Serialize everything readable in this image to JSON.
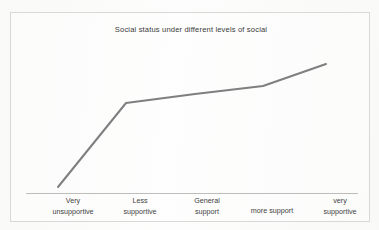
{
  "chart_data": {
    "type": "line",
    "title": "Social status under different levels of social",
    "xlabel": "",
    "ylabel": "",
    "categories": [
      "Very unsupportive",
      "Less supportive",
      "General support",
      "more support",
      "very supportive"
    ],
    "category_lines": [
      [
        "Very",
        "unsupportive"
      ],
      [
        "Less",
        "supportive"
      ],
      [
        "General",
        "support"
      ],
      [
        "more support",
        ""
      ],
      [
        "very",
        "supportive"
      ]
    ],
    "series": [
      {
        "name": "Social status",
        "values": [
          0.05,
          0.72,
          0.79,
          0.86,
          1.04
        ]
      }
    ],
    "points_px": [
      {
        "x": 47,
        "y": 174
      },
      {
        "x": 115,
        "y": 90
      },
      {
        "x": 184,
        "y": 81
      },
      {
        "x": 252,
        "y": 73
      },
      {
        "x": 315,
        "y": 51
      }
    ],
    "ylim": [
      0,
      1.15
    ],
    "grid": false,
    "legend": false,
    "legend_position": "none",
    "line_color": "#7f7f7f",
    "line_width_px": 2,
    "axis_color": "#bdbdbb",
    "frame_color": "#d8d8d6",
    "background_color": "#fdfdfd",
    "title_color": "#3a3a3a",
    "label_color": "#3f3f3f"
  },
  "figure": {
    "title": "Social status under different levels of social"
  }
}
